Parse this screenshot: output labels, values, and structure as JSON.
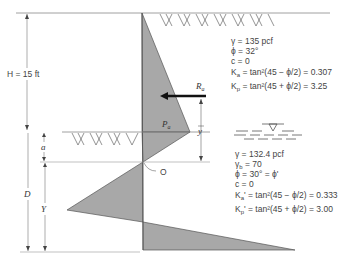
{
  "diagram": {
    "type": "sheet-pile-wall-cantilever-pressure-diagram",
    "labels": {
      "H": "H = 15 ft",
      "D": "D",
      "Y": "Y",
      "a": "a",
      "Pa": "P",
      "Pa_sub": "a",
      "Ra": "R",
      "Ra_sub": "a",
      "ybar": "y",
      "O": "O"
    },
    "upper_soil": {
      "gamma": "γ = 135 pcf",
      "phi": "ϕ = 32°",
      "c": "c = 0",
      "Ka": "K",
      "Ka_sub": "a",
      "Ka_expr": " = tan²(45 − ϕ/2) = 0.307",
      "Kp": "K",
      "Kp_sub": "p",
      "Kp_expr": " = tan²(45 + ϕ/2) = 3.25"
    },
    "lower_soil": {
      "gamma": "γ = 132.4 pcf",
      "gamma_b": "γ",
      "gamma_b_sub": "b",
      "gamma_b_val": " = 70",
      "phi": "ϕ = 30° = ϕ'",
      "c": "c = 0",
      "Ka": "K",
      "Ka_sub": "a",
      "Ka_expr": "' = tan²(45 − ϕ/2) = 0.333",
      "Kp": "K",
      "Kp_sub": "p",
      "Kp_expr": "' = tan²(45 + ϕ/2) = 3.00"
    },
    "colors": {
      "fill": "#a8a8a8",
      "line": "#555555",
      "arrow": "#111111"
    }
  }
}
